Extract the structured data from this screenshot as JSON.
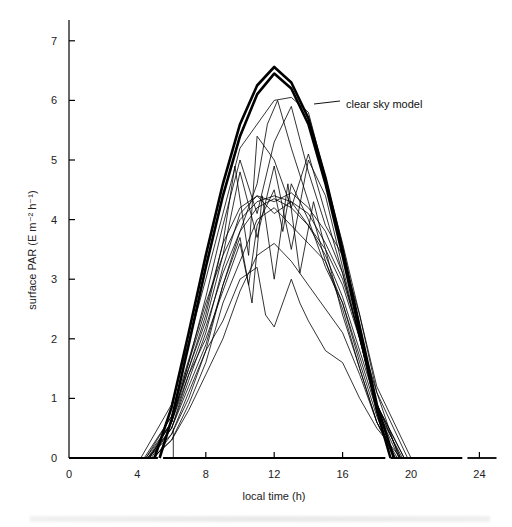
{
  "chart_data": {
    "type": "line",
    "title": "",
    "xlabel": "local time (h)",
    "ylabel": "surface PAR (E m⁻² h⁻¹)",
    "xlim": [
      0,
      24
    ],
    "ylim": [
      0,
      7
    ],
    "xticks": [
      0,
      4,
      8,
      12,
      16,
      20,
      24
    ],
    "yticks": [
      0,
      1,
      2,
      3,
      4,
      5,
      6,
      7
    ],
    "grid": false,
    "legend": null,
    "annotations": [
      {
        "text": "clear sky model",
        "x": 15.2,
        "y": 6.0
      }
    ],
    "series": [
      {
        "name": "clear sky model (upper)",
        "style": "thick",
        "x": [
          5.0,
          6,
          7,
          8,
          9,
          10,
          11,
          12,
          13,
          14,
          15,
          16,
          17,
          18,
          19.0
        ],
        "values": [
          0.0,
          0.85,
          2.1,
          3.4,
          4.6,
          5.6,
          6.25,
          6.56,
          6.3,
          5.7,
          4.7,
          3.5,
          2.2,
          0.9,
          0.0
        ]
      },
      {
        "name": "clear sky model (lower)",
        "style": "thick",
        "x": [
          5.3,
          6,
          7,
          8,
          9,
          10,
          11,
          12,
          13,
          14,
          15,
          16,
          17,
          18,
          18.8
        ],
        "values": [
          0.0,
          0.65,
          1.9,
          3.2,
          4.4,
          5.4,
          6.1,
          6.45,
          6.2,
          5.6,
          4.6,
          3.4,
          2.1,
          0.8,
          0.0
        ]
      },
      {
        "name": "observed day 1",
        "x": [
          4.2,
          6,
          8,
          10,
          12,
          13,
          14,
          16,
          18,
          20
        ],
        "values": [
          0,
          0.9,
          3.0,
          5.2,
          6.0,
          6.05,
          5.8,
          3.6,
          1.2,
          0
        ]
      },
      {
        "name": "observed day 2",
        "x": [
          4.4,
          6,
          8,
          9,
          10,
          11,
          12,
          13,
          14,
          15,
          16,
          18,
          19.8
        ],
        "values": [
          0,
          0.7,
          2.6,
          3.4,
          4.0,
          4.3,
          4.4,
          4.3,
          4.1,
          3.6,
          3.0,
          1.1,
          0
        ]
      },
      {
        "name": "observed day 3",
        "x": [
          4.5,
          6,
          8,
          9,
          10,
          11,
          12,
          13,
          14,
          15,
          16,
          18,
          19.6
        ],
        "values": [
          0,
          0.6,
          2.2,
          3.1,
          3.8,
          4.2,
          4.35,
          4.2,
          3.9,
          3.4,
          2.7,
          0.9,
          0
        ]
      },
      {
        "name": "observed day 4",
        "x": [
          4.6,
          6,
          7,
          8,
          9,
          10,
          10.5,
          11,
          12,
          12.5,
          13,
          14,
          15,
          16,
          17,
          18,
          19.5
        ],
        "values": [
          0,
          0.5,
          1.4,
          2.0,
          2.8,
          3.6,
          2.9,
          3.9,
          4.5,
          3.8,
          4.6,
          4.0,
          3.2,
          2.6,
          1.7,
          0.8,
          0
        ]
      },
      {
        "name": "observed day 5",
        "x": [
          4.6,
          6,
          7,
          8,
          9,
          10,
          11,
          11.5,
          12,
          13,
          13.5,
          14,
          15,
          16,
          17,
          18,
          19.4
        ],
        "values": [
          0,
          0.4,
          1.1,
          1.8,
          2.3,
          3.0,
          3.2,
          2.4,
          2.2,
          3.0,
          2.6,
          2.3,
          1.8,
          1.6,
          1.0,
          0.5,
          0
        ]
      },
      {
        "name": "observed day 6",
        "x": [
          4.7,
          6,
          7,
          8,
          9,
          10,
          11,
          12,
          13,
          14,
          15,
          16,
          17,
          18,
          19.3
        ],
        "values": [
          0,
          0.6,
          1.6,
          2.7,
          3.9,
          5.0,
          4.1,
          5.3,
          5.9,
          4.8,
          3.9,
          3.4,
          2.4,
          1.1,
          0
        ]
      },
      {
        "name": "observed day 7",
        "x": [
          4.5,
          6,
          7,
          8,
          9,
          10,
          11,
          12,
          13,
          14,
          15,
          16,
          17,
          18,
          19.6
        ],
        "values": [
          0,
          0.7,
          1.5,
          2.3,
          3.4,
          4.8,
          3.7,
          4.9,
          3.5,
          5.0,
          4.4,
          3.2,
          2.0,
          0.9,
          0
        ]
      },
      {
        "name": "observed day 8",
        "x": [
          4.8,
          6,
          7,
          8,
          9,
          10,
          10.7,
          11.3,
          12,
          12.8,
          13.5,
          14.3,
          15,
          16,
          17,
          18,
          19.2
        ],
        "values": [
          0,
          0.5,
          1.2,
          1.9,
          2.9,
          3.7,
          2.6,
          4.4,
          3.0,
          4.6,
          3.1,
          4.3,
          3.5,
          2.4,
          1.5,
          0.6,
          0
        ]
      },
      {
        "name": "observed day 9",
        "x": [
          4.7,
          6,
          7,
          8,
          9,
          10,
          11,
          12,
          13,
          14,
          15,
          16,
          17,
          18,
          19.4
        ],
        "values": [
          0,
          0.5,
          1.3,
          2.1,
          3.2,
          4.1,
          4.4,
          4.3,
          4.45,
          4.2,
          3.8,
          3.1,
          2.0,
          0.9,
          0
        ]
      },
      {
        "name": "observed day 10",
        "x": [
          4.9,
          6,
          7,
          8,
          9,
          10,
          11,
          12,
          13,
          14,
          15,
          16,
          17,
          18,
          19.1
        ],
        "values": [
          0,
          0.3,
          0.8,
          1.4,
          2.0,
          2.8,
          3.4,
          3.6,
          3.3,
          2.9,
          2.5,
          2.1,
          1.4,
          0.6,
          0
        ]
      },
      {
        "name": "observed day 11",
        "x": [
          4.6,
          6,
          7,
          8,
          9,
          9.7,
          10.5,
          11,
          12,
          13,
          14,
          15,
          16,
          17,
          18,
          19.4
        ],
        "values": [
          0,
          0.6,
          1.6,
          2.5,
          3.6,
          4.9,
          3.4,
          5.4,
          5.0,
          4.2,
          5.1,
          4.1,
          3.1,
          2.0,
          0.9,
          0
        ]
      },
      {
        "name": "observed day 12",
        "x": [
          4.9,
          6,
          7,
          8,
          9,
          10,
          11,
          12,
          13,
          14,
          15,
          16,
          17,
          18,
          19.0
        ],
        "values": [
          0,
          0.3,
          0.9,
          1.6,
          2.6,
          3.3,
          4.0,
          4.2,
          3.9,
          3.6,
          3.3,
          2.6,
          1.6,
          0.7,
          0
        ]
      },
      {
        "name": "observed day 13",
        "x": [
          4.7,
          6,
          7,
          8,
          9,
          10,
          11,
          12,
          13,
          14,
          15,
          16,
          17,
          18,
          19.3
        ],
        "values": [
          0,
          0.6,
          1.5,
          2.4,
          3.6,
          4.2,
          4.4,
          4.1,
          4.3,
          3.9,
          3.5,
          2.9,
          2.0,
          0.8,
          0
        ]
      },
      {
        "name": "observed day 14",
        "x": [
          5.0,
          6,
          7,
          8,
          9,
          10,
          11,
          11.6,
          12.2,
          13,
          14,
          15,
          16,
          17,
          18,
          19.0
        ],
        "values": [
          0,
          0.4,
          1.0,
          1.8,
          2.9,
          3.8,
          4.6,
          5.6,
          6.0,
          5.2,
          4.3,
          3.3,
          2.5,
          1.5,
          0.6,
          0
        ]
      }
    ]
  },
  "axes": {
    "ylabel": "surface PAR (E m⁻² h⁻¹)",
    "xlabel": "local time (h)",
    "xtick_labels": [
      "0",
      "4",
      "8",
      "12",
      "16",
      "20",
      "24"
    ],
    "ytick_labels": [
      "0",
      "1",
      "2",
      "3",
      "4",
      "5",
      "6",
      "7"
    ]
  },
  "annotation": {
    "label": "clear sky model"
  }
}
